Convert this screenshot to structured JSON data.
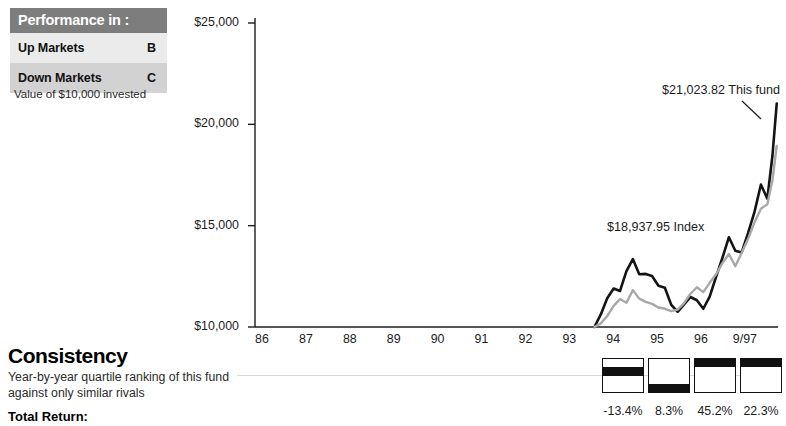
{
  "performance_table": {
    "header": "Performance in :",
    "rows": [
      {
        "label": "Up Markets",
        "grade": "B"
      },
      {
        "label": "Down Markets",
        "grade": "C"
      }
    ],
    "header_bg": "#7d7d7d",
    "row_light_bg": "#ebebeb",
    "row_dark_bg": "#d2d2d2"
  },
  "value_note": "Value of $10,000 invested",
  "consistency": {
    "title": "Consistency",
    "description": "Year-by-year quartile ranking of this fund against only similar rivals",
    "total_return_label": "Total Return:",
    "quartiles": [
      {
        "rank": 2,
        "return": "-13.4%"
      },
      {
        "rank": 4,
        "return": "8.3%"
      },
      {
        "rank": 1,
        "return": "45.2%"
      },
      {
        "rank": 1,
        "return": "22.3%"
      }
    ]
  },
  "chart_data": {
    "type": "line",
    "title": "",
    "xlabel": "",
    "ylabel": "",
    "ylim": [
      10000,
      25000
    ],
    "ytick_labels": [
      "$25,000",
      "$20,000",
      "$15,000",
      "$10,000"
    ],
    "ytick_values": [
      25000,
      20000,
      15000,
      10000
    ],
    "xtick_labels": [
      "86",
      "87",
      "88",
      "89",
      "90",
      "91",
      "92",
      "93",
      "94",
      "95",
      "96",
      "9/97"
    ],
    "grid": false,
    "legend": "annotations",
    "annotations": [
      {
        "text": "$21,023.82 This fund",
        "series": "This fund"
      },
      {
        "text": "$18,937.95 Index",
        "series": "Index"
      }
    ],
    "series": [
      {
        "name": "This fund",
        "color": "#141414",
        "x": [
          93.45,
          93.6,
          93.75,
          93.9,
          94.05,
          94.2,
          94.35,
          94.5,
          94.65,
          94.8,
          94.95,
          95.1,
          95.25,
          95.4,
          95.55,
          95.7,
          95.85,
          96.0,
          96.15,
          96.3,
          96.45,
          96.6,
          96.75,
          96.9,
          97.05,
          97.2,
          97.35,
          97.5,
          97.62,
          97.72
        ],
        "values": [
          10000,
          10620,
          11420,
          11900,
          11780,
          12760,
          13350,
          12600,
          12620,
          12520,
          12040,
          11940,
          11090,
          10750,
          11120,
          11480,
          11320,
          10900,
          11500,
          12480,
          13420,
          14430,
          13760,
          13680,
          14640,
          15680,
          17030,
          16330,
          18450,
          21024
        ]
      },
      {
        "name": "Index",
        "color": "#a8a8a8",
        "x": [
          93.45,
          93.6,
          93.75,
          93.9,
          94.05,
          94.2,
          94.35,
          94.5,
          94.65,
          94.8,
          94.95,
          95.1,
          95.25,
          95.4,
          95.55,
          95.7,
          95.85,
          96.0,
          96.15,
          96.3,
          96.45,
          96.6,
          96.75,
          96.9,
          97.05,
          97.2,
          97.35,
          97.5,
          97.62,
          97.72
        ],
        "values": [
          10000,
          10180,
          10540,
          11040,
          11380,
          11200,
          11820,
          11400,
          11240,
          11140,
          10960,
          10900,
          10780,
          10860,
          11180,
          11640,
          11960,
          11720,
          12180,
          12600,
          13160,
          13600,
          13000,
          13660,
          14350,
          15160,
          15840,
          16060,
          17240,
          18938
        ]
      }
    ]
  }
}
